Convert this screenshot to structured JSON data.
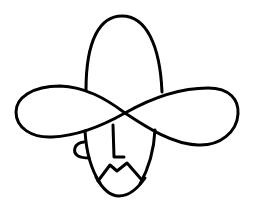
{
  "image": {
    "title": "Cowboy line drawing",
    "description": "Minimal black line drawing of a cowboy face wearing a tall-crowned hat with an infinity-shaped brim; nose drawn as the letter L, zigzag mustache and beard chin.",
    "background": "#ffffff",
    "stroke_color": "#000000",
    "nose_glyph": "L"
  }
}
